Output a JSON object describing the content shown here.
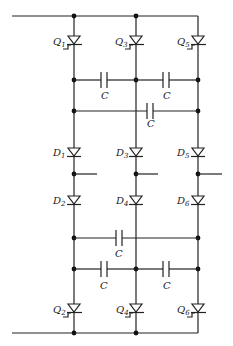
{
  "diagram": {
    "type": "circuit-schematic",
    "colors": {
      "line": "#222222",
      "background": "#ffffff"
    },
    "thyristors_top": [
      {
        "name": "Q",
        "sub": "1"
      },
      {
        "name": "Q",
        "sub": "3"
      },
      {
        "name": "Q",
        "sub": "5"
      }
    ],
    "diodes_upper": [
      {
        "name": "D",
        "sub": "1"
      },
      {
        "name": "D",
        "sub": "3"
      },
      {
        "name": "D",
        "sub": "5"
      }
    ],
    "diodes_lower": [
      {
        "name": "D",
        "sub": "2"
      },
      {
        "name": "D",
        "sub": "4"
      },
      {
        "name": "D",
        "sub": "6"
      }
    ],
    "thyristors_bottom": [
      {
        "name": "Q",
        "sub": "2"
      },
      {
        "name": "Q",
        "sub": "4"
      },
      {
        "name": "Q",
        "sub": "6"
      }
    ],
    "capacitor_label": "C",
    "capacitors": [
      {
        "label": "C"
      },
      {
        "label": "C"
      },
      {
        "label": "C"
      },
      {
        "label": "C"
      },
      {
        "label": "C"
      },
      {
        "label": "C"
      }
    ]
  }
}
